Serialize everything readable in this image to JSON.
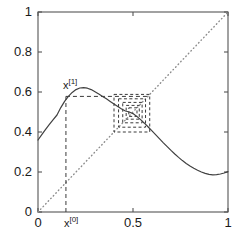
{
  "chart_data": {
    "type": "line",
    "title": "",
    "xlabel": "",
    "ylabel": "",
    "xlim": [
      0,
      1
    ],
    "ylim": [
      0,
      1
    ],
    "grid": false,
    "legend": null,
    "xticks": [
      0,
      0.5,
      1
    ],
    "xtick_labels": [
      "0",
      "0.5",
      "1"
    ],
    "yticks": [
      0,
      0.2,
      0.4,
      0.6,
      0.8,
      1
    ],
    "ytick_labels": [
      "0",
      "0.2",
      "0.4",
      "0.6",
      "0.8",
      "1"
    ],
    "series": [
      {
        "name": "map-function",
        "style": "solid",
        "color": "#404040",
        "x": [
          0.0,
          0.02,
          0.04,
          0.06,
          0.08,
          0.1,
          0.12,
          0.14,
          0.16,
          0.18,
          0.2,
          0.22,
          0.24,
          0.26,
          0.28,
          0.3,
          0.32,
          0.34,
          0.36,
          0.38,
          0.4,
          0.42,
          0.44,
          0.46,
          0.48,
          0.5,
          0.52,
          0.54,
          0.56,
          0.58,
          0.6,
          0.62,
          0.64,
          0.66,
          0.68,
          0.7,
          0.72,
          0.74,
          0.76,
          0.78,
          0.8,
          0.82,
          0.84,
          0.86,
          0.88,
          0.9,
          0.92,
          0.94,
          0.96,
          0.98,
          1.0
        ],
        "y": [
          0.36,
          0.387,
          0.413,
          0.438,
          0.462,
          0.485,
          0.522,
          0.553,
          0.578,
          0.598,
          0.612,
          0.62,
          0.622,
          0.619,
          0.612,
          0.601,
          0.59,
          0.578,
          0.566,
          0.553,
          0.54,
          0.527,
          0.515,
          0.505,
          0.5,
          0.492,
          0.478,
          0.462,
          0.444,
          0.425,
          0.406,
          0.386,
          0.366,
          0.346,
          0.327,
          0.308,
          0.29,
          0.273,
          0.257,
          0.243,
          0.23,
          0.219,
          0.209,
          0.2,
          0.193,
          0.188,
          0.186,
          0.187,
          0.19,
          0.195,
          0.202
        ]
      },
      {
        "name": "identity-line",
        "style": "dotted",
        "color": "#8c8c8c",
        "x": [
          0,
          1
        ],
        "y": [
          0,
          1
        ]
      }
    ],
    "annotations": [
      {
        "name": "x0-start-vertical-dashed",
        "style": "dashed",
        "type": "vline",
        "x": 0.147,
        "y0": 0.0,
        "y1": 0.578
      },
      {
        "name": "fx0-horizontal-dashed",
        "style": "dashed",
        "type": "hline",
        "y": 0.578,
        "x0": 0.147,
        "x1": 0.575
      },
      {
        "name": "cobweb-box-1",
        "style": "dashed",
        "type": "rect",
        "x0": 0.4,
        "y0": 0.4,
        "x1": 0.588,
        "y1": 0.588
      },
      {
        "name": "cobweb-box-2",
        "style": "dashed",
        "type": "rect",
        "x0": 0.424,
        "y0": 0.424,
        "x1": 0.566,
        "y1": 0.566
      },
      {
        "name": "cobweb-box-3",
        "style": "dashed",
        "type": "rect",
        "x0": 0.446,
        "y0": 0.446,
        "x1": 0.548,
        "y1": 0.548
      },
      {
        "name": "cobweb-box-4",
        "style": "dashed",
        "type": "rect",
        "x0": 0.464,
        "y0": 0.464,
        "x1": 0.533,
        "y1": 0.533
      },
      {
        "name": "cobweb-box-5",
        "style": "dashed",
        "type": "rect",
        "x0": 0.478,
        "y0": 0.478,
        "x1": 0.521,
        "y1": 0.521
      },
      {
        "name": "fixed-point",
        "type": "point",
        "x": 0.5,
        "y": 0.5
      }
    ],
    "point_labels": [
      {
        "name": "x1-label",
        "text": "x",
        "superscript": "[1]",
        "x": 0.147,
        "y": 0.578
      },
      {
        "name": "x0-label",
        "text": "x",
        "superscript": "[0]",
        "x": 0.147,
        "y": 0.0
      }
    ]
  },
  "axes": {
    "frame_color": "#555555",
    "tick_color": "#555555",
    "label_color": "#1a1a1a"
  },
  "labels": {
    "x0": {
      "base": "x",
      "sup": "[0]"
    },
    "x1": {
      "base": "x",
      "sup": "[1]"
    }
  }
}
